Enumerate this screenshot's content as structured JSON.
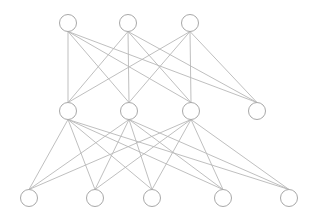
{
  "diagram": {
    "type": "neural-network",
    "node_radius": 8.5,
    "colors": {
      "edge": "#b8b8b8",
      "node_stroke": "#a8a8a8",
      "node_fill": "#ffffff",
      "background": "#ffffff"
    },
    "layers": [
      {
        "name": "layer-1",
        "nodes": [
          {
            "x": 68,
            "y": 23
          },
          {
            "x": 128,
            "y": 23
          },
          {
            "x": 190,
            "y": 23
          }
        ]
      },
      {
        "name": "layer-2",
        "nodes": [
          {
            "x": 68,
            "y": 111
          },
          {
            "x": 129,
            "y": 111
          },
          {
            "x": 191,
            "y": 111
          },
          {
            "x": 257,
            "y": 111
          }
        ]
      },
      {
        "name": "layer-3",
        "nodes": [
          {
            "x": 29,
            "y": 198
          },
          {
            "x": 95,
            "y": 198
          },
          {
            "x": 152,
            "y": 198
          },
          {
            "x": 223,
            "y": 198
          },
          {
            "x": 289,
            "y": 198
          }
        ]
      }
    ],
    "edges": [
      {
        "from": [
          0,
          0
        ],
        "to": [
          1,
          0
        ]
      },
      {
        "from": [
          0,
          0
        ],
        "to": [
          1,
          1
        ]
      },
      {
        "from": [
          0,
          0
        ],
        "to": [
          1,
          2
        ]
      },
      {
        "from": [
          0,
          0
        ],
        "to": [
          1,
          3
        ]
      },
      {
        "from": [
          0,
          1
        ],
        "to": [
          1,
          0
        ]
      },
      {
        "from": [
          0,
          1
        ],
        "to": [
          1,
          1
        ]
      },
      {
        "from": [
          0,
          1
        ],
        "to": [
          1,
          2
        ]
      },
      {
        "from": [
          0,
          1
        ],
        "to": [
          1,
          3
        ]
      },
      {
        "from": [
          0,
          2
        ],
        "to": [
          1,
          0
        ]
      },
      {
        "from": [
          0,
          2
        ],
        "to": [
          1,
          1
        ]
      },
      {
        "from": [
          0,
          2
        ],
        "to": [
          1,
          2
        ]
      },
      {
        "from": [
          0,
          2
        ],
        "to": [
          1,
          3
        ]
      },
      {
        "from": [
          1,
          0
        ],
        "to": [
          2,
          0
        ]
      },
      {
        "from": [
          1,
          0
        ],
        "to": [
          2,
          1
        ]
      },
      {
        "from": [
          1,
          0
        ],
        "to": [
          2,
          2
        ]
      },
      {
        "from": [
          1,
          0
        ],
        "to": [
          2,
          3
        ]
      },
      {
        "from": [
          1,
          0
        ],
        "to": [
          2,
          4
        ]
      },
      {
        "from": [
          1,
          1
        ],
        "to": [
          2,
          0
        ]
      },
      {
        "from": [
          1,
          1
        ],
        "to": [
          2,
          1
        ]
      },
      {
        "from": [
          1,
          1
        ],
        "to": [
          2,
          2
        ]
      },
      {
        "from": [
          1,
          1
        ],
        "to": [
          2,
          3
        ]
      },
      {
        "from": [
          1,
          1
        ],
        "to": [
          2,
          4
        ]
      },
      {
        "from": [
          1,
          2
        ],
        "to": [
          2,
          0
        ]
      },
      {
        "from": [
          1,
          2
        ],
        "to": [
          2,
          1
        ]
      },
      {
        "from": [
          1,
          2
        ],
        "to": [
          2,
          2
        ]
      },
      {
        "from": [
          1,
          2
        ],
        "to": [
          2,
          3
        ]
      },
      {
        "from": [
          1,
          2
        ],
        "to": [
          2,
          4
        ]
      }
    ]
  }
}
